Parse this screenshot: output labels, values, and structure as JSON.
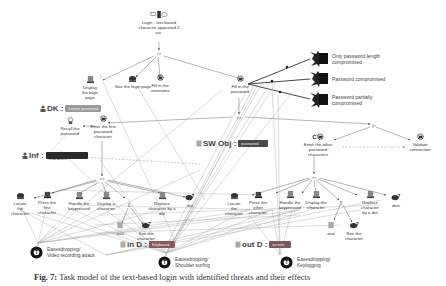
{
  "figure": {
    "caption_label": "Fig. 7:",
    "caption_text": "Task model of the text-based login with identified threats and their effects"
  },
  "nodes": {
    "root": "Login - text based character appeared 2 sec.",
    "root_op": ">>",
    "display_login_page": "Display the login page",
    "see_login_page": "See the login page",
    "fill_username": "Fill in the username",
    "fill_password": "Fill in the password",
    "password_op": ">>",
    "recall_password": "Recall the password",
    "enter_first_char": "Enter the first password character",
    "enter_other_chars": "Enter the other password characters",
    "first_op": ">>",
    "other_op": ">>",
    "enable_op": "[>",
    "validate_connection": "Validate connection",
    "left_group": {
      "locate": "Locate the character",
      "press": "Press the first character",
      "handle": "Handle the keypressed",
      "display": "Display a character",
      "choice_op": "[]",
      "replace": "Replace character by a dot",
      "delay": "dot",
      "wait": "wait",
      "see": "See the character"
    },
    "right_group": {
      "locate": "Locate the character",
      "press": "Press the other character",
      "handle": "Handle the keypressed",
      "display": "Display the character",
      "choice_op": "[]",
      "replace": "Replace character by a dot",
      "delay": "dots",
      "wait": "wait",
      "see": "See the character"
    }
  },
  "knowledge_tags": {
    "dk": {
      "label": "DK :",
      "value": "known password",
      "color": "#9a9a9a"
    },
    "inf": {
      "label": "Inf :",
      "value": "password characters",
      "color": "#2a2a2a"
    },
    "sw_obj": {
      "label": "SW Obj :",
      "value": "password",
      "color": "#4a4a4a"
    },
    "in_d": {
      "label": "in D :",
      "value": "Keyboard",
      "color": "#8a5a5a"
    },
    "out_d": {
      "label": "out D :",
      "value": "screen",
      "color": "#7a5a5a"
    }
  },
  "outcomes": [
    {
      "label": "Only password length compromised"
    },
    {
      "label": "Password compromised"
    },
    {
      "label": "Password partially compromised"
    }
  ],
  "attacks": [
    {
      "id": "T",
      "line1": "Eavesdropping/",
      "line2": "Video recording attack"
    },
    {
      "id": "T",
      "line1": "Eavesdropping/",
      "line2": "Shoulder surfing"
    },
    {
      "id": "T",
      "line1": "Eavesdropping/",
      "line2": "Keylogging"
    }
  ],
  "colors": {
    "edge": "#6a6a6a",
    "edge_light": "#9a9a9a",
    "icon_dark": "#2a2a2a",
    "background": "#ffffff"
  }
}
